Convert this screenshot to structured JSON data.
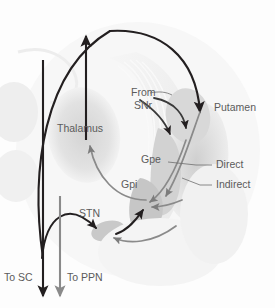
{
  "figure": {
    "background_color": "#fdfdfd"
  },
  "colors": {
    "black_pathway": "#231f20",
    "gray_pathway": "#7c7c7c",
    "label_text": "#5b5b5b",
    "nucleus_fill": "#c9c9c9",
    "nucleus_fill_light": "#dedede",
    "leader_line": "#6e6e6e"
  },
  "labels": {
    "thalamus": "Thalamus",
    "putamen": "Putamen",
    "gpe": "Gpe",
    "gpi": "Gpi",
    "stn": "STN",
    "from": "From",
    "snr": "SNr",
    "direct": "Direct",
    "indirect": "Indirect",
    "to_sc": "To SC",
    "to_ppn": "To PPN"
  },
  "structures": [
    {
      "name": "thalamus",
      "label": "Thalamus"
    },
    {
      "name": "putamen",
      "label": "Putamen"
    },
    {
      "name": "globus-pallidus-externa",
      "label": "Gpe"
    },
    {
      "name": "globus-pallidus-interna",
      "label": "Gpi"
    },
    {
      "name": "subthalamic-nucleus",
      "label": "STN"
    }
  ],
  "pathways": [
    {
      "name": "cortex-to-putamen",
      "color": "black",
      "from": "Cortex",
      "to": "Putamen"
    },
    {
      "name": "snr-to-putamen",
      "color": "black",
      "from": "SNr",
      "to": "Putamen"
    },
    {
      "name": "putamen-to-gpi-direct",
      "color": "gray",
      "from": "Putamen",
      "to": "Gpi",
      "route": "Direct"
    },
    {
      "name": "putamen-to-gpe-indirect",
      "color": "gray",
      "from": "Putamen",
      "to": "Gpe",
      "route": "Indirect"
    },
    {
      "name": "gpe-to-stn",
      "color": "gray",
      "from": "Gpe",
      "to": "STN"
    },
    {
      "name": "stn-to-gpi",
      "color": "black",
      "from": "STN",
      "to": "Gpi"
    },
    {
      "name": "gpi-to-thalamus",
      "color": "gray",
      "from": "Gpi",
      "to": "Thalamus"
    },
    {
      "name": "thalamus-to-cortex",
      "color": "black",
      "from": "Thalamus",
      "to": "Cortex"
    },
    {
      "name": "output-to-sc",
      "color": "black",
      "from": "Gpi/SNr",
      "to": "SC"
    },
    {
      "name": "output-to-ppn",
      "color": "gray",
      "from": "Gpi/SNr",
      "to": "PPN"
    }
  ]
}
